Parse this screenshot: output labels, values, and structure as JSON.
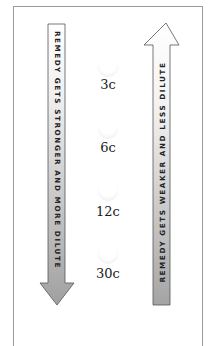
{
  "diagram": {
    "left_arrow": {
      "direction": "down",
      "label": "REMEDY GETS STRONGER AND MORE DILUTE",
      "gradient_top": "#ffffff",
      "gradient_bottom": "#a8a8a8"
    },
    "right_arrow": {
      "direction": "up",
      "label": "REMEDY GETS WEAKER AND LESS DILUTE",
      "gradient_top": "#ffffff",
      "gradient_bottom": "#a8a8a8"
    },
    "potencies": [
      {
        "label": "3c"
      },
      {
        "label": "6c"
      },
      {
        "label": "12c"
      },
      {
        "label": "30c"
      }
    ],
    "colors": {
      "frame_border": "#9a9a9a",
      "arrow_outline": "#555555",
      "text": "#1a1a1a"
    }
  }
}
